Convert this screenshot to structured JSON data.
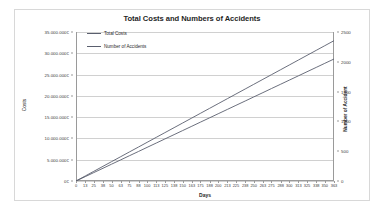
{
  "chart_data": {
    "type": "line",
    "title": "Total Costs and Numbers of Accidents",
    "xlabel": "Days",
    "ylabel": "Costs",
    "y2label": "Number of Accident",
    "grid": true,
    "legend_position": "top-left-inside",
    "xlim": [
      0,
      363
    ],
    "ylim": [
      0,
      35000000
    ],
    "y2lim": [
      0,
      2500
    ],
    "x_tick_labels": [
      "0",
      "13",
      "25",
      "38",
      "50",
      "63",
      "75",
      "88",
      "100",
      "113",
      "125",
      "138",
      "150",
      "163",
      "175",
      "188",
      "200",
      "213",
      "225",
      "238",
      "250",
      "263",
      "275",
      "288",
      "300",
      "313",
      "325",
      "338",
      "350",
      "363"
    ],
    "x_tick_values": [
      0,
      13,
      25,
      38,
      50,
      63,
      75,
      88,
      100,
      113,
      125,
      138,
      150,
      163,
      175,
      188,
      200,
      213,
      225,
      238,
      250,
      263,
      275,
      288,
      300,
      313,
      325,
      338,
      350,
      363
    ],
    "y_tick_labels": [
      "0€",
      "5.000.000€",
      "10.000.000€",
      "15.000.000€",
      "20.000.000€",
      "25.000.000€",
      "30.000.000€",
      "35.000.000€"
    ],
    "y_tick_values": [
      0,
      5000000,
      10000000,
      15000000,
      20000000,
      25000000,
      30000000,
      35000000
    ],
    "y2_tick_labels": [
      "0",
      "500",
      "1000",
      "1500",
      "2000",
      "2500"
    ],
    "y2_tick_values": [
      0,
      500,
      1000,
      1500,
      2000,
      2500
    ],
    "series": [
      {
        "name": "Total Costs",
        "axis": "left",
        "color": "#5a5f6e",
        "x": [
          0,
          13,
          25,
          38,
          50,
          63,
          75,
          88,
          100,
          113,
          125,
          138,
          150,
          163,
          175,
          188,
          200,
          213,
          225,
          238,
          250,
          263,
          275,
          288,
          300,
          313,
          325,
          338,
          350,
          363
        ],
        "values": [
          0,
          1180000,
          2270000,
          3450000,
          4540000,
          5720000,
          6810000,
          7990000,
          9080000,
          10260000,
          11350000,
          12530000,
          13620000,
          14800000,
          15890000,
          17070000,
          18160000,
          19340000,
          20430000,
          21610000,
          22700000,
          23880000,
          24970000,
          26150000,
          27240000,
          28420000,
          29510000,
          30690000,
          31780000,
          32960000
        ]
      },
      {
        "name": "Number of Accidents",
        "axis": "right",
        "color": "#5a5f6e",
        "x": [
          0,
          13,
          25,
          38,
          50,
          63,
          75,
          88,
          100,
          113,
          125,
          138,
          150,
          163,
          175,
          188,
          200,
          213,
          225,
          238,
          250,
          263,
          275,
          288,
          300,
          313,
          325,
          338,
          350,
          363
        ],
        "values": [
          0,
          73,
          141,
          214,
          282,
          355,
          423,
          496,
          564,
          637,
          705,
          778,
          846,
          919,
          987,
          1060,
          1128,
          1201,
          1269,
          1342,
          1410,
          1483,
          1551,
          1624,
          1692,
          1765,
          1833,
          1906,
          1974,
          2047
        ]
      }
    ]
  },
  "legend": {
    "entries": [
      {
        "label": "Total Costs"
      },
      {
        "label": "Number of Accidents"
      }
    ]
  }
}
